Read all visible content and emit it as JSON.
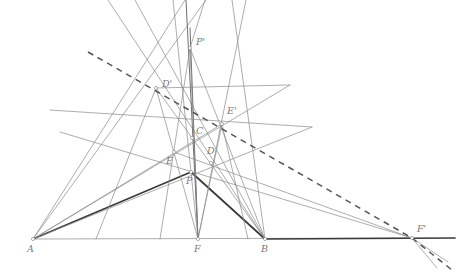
{
  "figure": {
    "kind": "geometry-diagram",
    "width": 471,
    "height": 277,
    "background": "#ffffff",
    "stroke_thin": "#8a8a8a",
    "stroke_mid": "#707070",
    "stroke_thick": "#3a3a3a",
    "stroke_dashed": "#555555",
    "label_color": "#7a7a7a",
    "marker_color": "#909090"
  },
  "points": [
    {
      "id": "A",
      "label": "A",
      "x": 33,
      "y": 239,
      "lx": 27,
      "ly": 252
    },
    {
      "id": "F",
      "label": "F",
      "x": 198,
      "y": 239,
      "lx": 194,
      "ly": 252
    },
    {
      "id": "B",
      "label": "B",
      "x": 265,
      "y": 239,
      "lx": 261,
      "ly": 252
    },
    {
      "id": "Fp",
      "label": "F'",
      "x": 412,
      "y": 238,
      "lx": 417,
      "ly": 232
    },
    {
      "id": "C",
      "label": "C",
      "x": 192,
      "y": 138,
      "lx": 196,
      "ly": 134
    },
    {
      "id": "E",
      "label": "E",
      "x": 174,
      "y": 152,
      "lx": 166,
      "ly": 164
    },
    {
      "id": "D",
      "label": "D",
      "x": 211,
      "y": 163,
      "lx": 207,
      "ly": 154
    },
    {
      "id": "P",
      "label": "P",
      "x": 191,
      "y": 172,
      "lx": 186,
      "ly": 184
    },
    {
      "id": "Pp",
      "label": "P'",
      "x": 190,
      "y": 48,
      "lx": 196,
      "ly": 45
    },
    {
      "id": "Dp",
      "label": "D'",
      "x": 156,
      "y": 88,
      "lx": 162,
      "ly": 87
    },
    {
      "id": "Ep",
      "label": "E'",
      "x": 222,
      "y": 124,
      "lx": 227,
      "ly": 114
    }
  ],
  "segments": [
    {
      "name": "base-line-A-Fprime",
      "x1": 33,
      "y1": 239,
      "x2": 412,
      "y2": 238,
      "weight": "thin"
    },
    {
      "name": "base-heavy-B-Fprime",
      "x1": 265,
      "y1": 239,
      "x2": 455,
      "y2": 238,
      "weight": "thick"
    },
    {
      "name": "heavy-A-P",
      "x1": 33,
      "y1": 239,
      "x2": 191,
      "y2": 172,
      "weight": "thick"
    },
    {
      "name": "heavy-P-B",
      "x1": 191,
      "y1": 172,
      "x2": 265,
      "y2": 239,
      "weight": "thick"
    },
    {
      "name": "A-to-Pprime-ray",
      "x1": 33,
      "y1": 239,
      "x2": 206,
      "y2": 0,
      "weight": "thin"
    },
    {
      "name": "A-to-Dprime-ray",
      "x1": 33,
      "y1": 239,
      "x2": 185,
      "y2": 0,
      "weight": "thin"
    },
    {
      "name": "A-to-Eprime-line",
      "x1": 33,
      "y1": 239,
      "x2": 312,
      "y2": 127,
      "weight": "thin"
    },
    {
      "name": "A-to-D-line",
      "x1": 33,
      "y1": 239,
      "x2": 290,
      "y2": 85,
      "weight": "thin"
    },
    {
      "name": "B-to-Dprime-ray",
      "x1": 265,
      "y1": 239,
      "x2": 135,
      "y2": 0,
      "weight": "thin"
    },
    {
      "name": "B-to-Eprime-ray",
      "x1": 265,
      "y1": 239,
      "x2": 232,
      "y2": 0,
      "weight": "thin"
    },
    {
      "name": "B-to-E-line",
      "x1": 265,
      "y1": 239,
      "x2": 108,
      "y2": 0,
      "weight": "thin"
    },
    {
      "name": "F-to-Pprime-ray",
      "x1": 198,
      "y1": 239,
      "x2": 186,
      "y2": 0,
      "weight": "mid"
    },
    {
      "name": "F-to-Dprime-ray",
      "x1": 198,
      "y1": 239,
      "x2": 173,
      "y2": 0,
      "weight": "thin"
    },
    {
      "name": "F-to-Eprime-ray",
      "x1": 198,
      "y1": 239,
      "x2": 246,
      "y2": 0,
      "weight": "thin"
    },
    {
      "name": "F-to-C-ray",
      "x1": 198,
      "y1": 239,
      "x2": 190,
      "y2": 28,
      "weight": "mid"
    },
    {
      "name": "Dprime-to-F-through-E",
      "x1": 156,
      "y1": 88,
      "x2": 198,
      "y2": 239,
      "weight": "thin"
    },
    {
      "name": "Eprime-to-F-through-D",
      "x1": 222,
      "y1": 124,
      "x2": 198,
      "y2": 239,
      "weight": "thin"
    },
    {
      "name": "Dprime-to-B-line",
      "x1": 156,
      "y1": 88,
      "x2": 265,
      "y2": 239,
      "weight": "thin"
    },
    {
      "name": "Eprime-to-A-line",
      "x1": 222,
      "y1": 124,
      "x2": 33,
      "y2": 239,
      "weight": "thin"
    },
    {
      "name": "Pprime-to-F-ray",
      "x1": 190,
      "y1": 48,
      "x2": 198,
      "y2": 239,
      "weight": "thin"
    },
    {
      "name": "Pprime-to-D-to-B",
      "x1": 190,
      "y1": 48,
      "x2": 265,
      "y2": 239,
      "weight": "thin"
    },
    {
      "name": "Pprime-to-E-to-A-ray",
      "x1": 190,
      "y1": 48,
      "x2": 160,
      "y2": 239,
      "weight": "thin"
    },
    {
      "name": "Pprime-upper-ray",
      "x1": 190,
      "y1": 48,
      "x2": 205,
      "y2": 0,
      "weight": "thin"
    },
    {
      "name": "Dprime-to-Eprime-extend-right",
      "x1": 156,
      "y1": 88,
      "x2": 290,
      "y2": 85,
      "weight": "thin"
    },
    {
      "name": "transversal-upperleft-to-lowerright",
      "x1": 50,
      "y1": 110,
      "x2": 312,
      "y2": 127,
      "weight": "thin"
    },
    {
      "name": "transversal-left-to-Fprime",
      "x1": 60,
      "y1": 132,
      "x2": 412,
      "y2": 238,
      "weight": "thin"
    },
    {
      "name": "Eprime-down-to-B-ray",
      "x1": 222,
      "y1": 124,
      "x2": 248,
      "y2": 239,
      "weight": "thin"
    },
    {
      "name": "Dprime-down-left-ray",
      "x1": 156,
      "y1": 88,
      "x2": 96,
      "y2": 239,
      "weight": "thin"
    },
    {
      "name": "E-to-Fprime-line",
      "x1": 174,
      "y1": 152,
      "x2": 412,
      "y2": 238,
      "weight": "thin"
    },
    {
      "name": "Fprime-lower-ray-1",
      "x1": 412,
      "y1": 238,
      "x2": 448,
      "y2": 262,
      "weight": "thin"
    },
    {
      "name": "Fprime-lower-ray-2",
      "x1": 412,
      "y1": 238,
      "x2": 437,
      "y2": 268,
      "weight": "thin"
    }
  ],
  "dashed_segments": [
    {
      "name": "dashed-main-Dprime-Eprime-Fprime",
      "x1": 88,
      "y1": 52,
      "x2": 412,
      "y2": 238
    },
    {
      "name": "dashed-beyond-Fprime",
      "x1": 412,
      "y1": 238,
      "x2": 452,
      "y2": 270
    }
  ],
  "caption": {
    "title": "",
    "notes": ""
  }
}
